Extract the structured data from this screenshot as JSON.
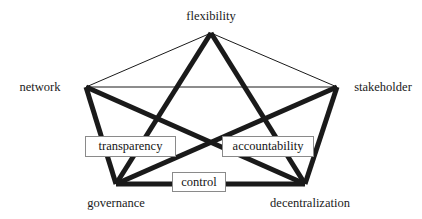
{
  "diagram": {
    "type": "undirected-graph",
    "shape": "pentagon",
    "background_color": "#ffffff",
    "line_color": "#1a1a1a",
    "thin_stroke_width": 1,
    "thick_stroke_width": 5,
    "box_border_color": "#8a8a8a",
    "box_fill_color": "#ffffff",
    "nodes": [
      {
        "id": "flexibility",
        "label": "flexibility",
        "x": 211,
        "y": 33,
        "label_x": 211,
        "label_y": 16,
        "label_anchor": "center"
      },
      {
        "id": "network",
        "label": "network",
        "x": 86,
        "y": 87,
        "label_x": 40,
        "label_y": 87,
        "label_anchor": "center"
      },
      {
        "id": "stakeholder",
        "label": "stakeholder",
        "x": 337,
        "y": 87,
        "label_x": 383,
        "label_y": 87,
        "label_anchor": "center"
      },
      {
        "id": "governance",
        "label": "governance",
        "x": 116,
        "y": 184,
        "label_x": 116,
        "label_y": 203,
        "label_anchor": "center"
      },
      {
        "id": "decentralization",
        "label": "decentralization",
        "x": 305,
        "y": 184,
        "label_x": 310,
        "label_y": 203,
        "label_anchor": "center"
      }
    ],
    "edges": [
      {
        "id": "flexibility-network",
        "from": "flexibility",
        "to": "network",
        "weight": "thin"
      },
      {
        "id": "flexibility-stakeholder",
        "from": "flexibility",
        "to": "stakeholder",
        "weight": "thin"
      },
      {
        "id": "network-stakeholder",
        "from": "network",
        "to": "stakeholder",
        "weight": "thin"
      },
      {
        "id": "flexibility-governance",
        "from": "flexibility",
        "to": "governance",
        "weight": "thick"
      },
      {
        "id": "flexibility-decentralization",
        "from": "flexibility",
        "to": "decentralization",
        "weight": "thick"
      },
      {
        "id": "network-governance",
        "from": "network",
        "to": "governance",
        "weight": "thick"
      },
      {
        "id": "network-decentralization",
        "from": "network",
        "to": "decentralization",
        "weight": "thick"
      },
      {
        "id": "stakeholder-governance",
        "from": "stakeholder",
        "to": "governance",
        "weight": "thick"
      },
      {
        "id": "stakeholder-decentralization",
        "from": "stakeholder",
        "to": "decentralization",
        "weight": "thick"
      },
      {
        "id": "governance-decentralization",
        "from": "governance",
        "to": "decentralization",
        "weight": "thick"
      }
    ],
    "edge_labels": [
      {
        "id": "transparency",
        "label": "transparency",
        "x": 85,
        "y": 136,
        "width": 91,
        "height": 21,
        "on_edge": "network-decentralization"
      },
      {
        "id": "accountability",
        "label": "accountability",
        "x": 222,
        "y": 136,
        "width": 92,
        "height": 21,
        "on_edge": "stakeholder-governance"
      },
      {
        "id": "control",
        "label": "control",
        "x": 172,
        "y": 172,
        "width": 54,
        "height": 20,
        "on_edge": "governance-decentralization"
      }
    ]
  }
}
